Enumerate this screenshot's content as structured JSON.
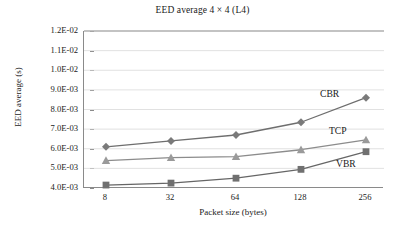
{
  "chart_data": {
    "type": "line",
    "title": "EED average 4 × 4 (L4)",
    "xlabel": "Packet size (bytes)",
    "ylabel": "EED average (s)",
    "categories": [
      "8",
      "32",
      "64",
      "128",
      "256"
    ],
    "xtick_labels": [
      "8",
      "32",
      "64",
      "128",
      "256"
    ],
    "ytick_labels": [
      "1.2E-02",
      "1.1E-02",
      "1.0E-02",
      "9.0E-03",
      "8.0E-03",
      "7.0E-03",
      "6.0E-03",
      "5.0E-03",
      "4.0E-03"
    ],
    "ytick_values": [
      0.012,
      0.011,
      0.01,
      0.009,
      0.008,
      0.007,
      0.006,
      0.005,
      0.004
    ],
    "ylim": [
      0.004,
      0.012
    ],
    "grid": "horizontal",
    "legend_position": "inline-annotations",
    "series": [
      {
        "name": "CBR",
        "marker": "diamond",
        "color": "#7a7a7a",
        "line_color": "#6e6e6e",
        "values": [
          0.0061,
          0.0064,
          0.0067,
          0.00735,
          0.0086
        ],
        "annotation": "CBR"
      },
      {
        "name": "TCP",
        "marker": "triangle",
        "color": "#9a9a9a",
        "line_color": "#8c8c8c",
        "values": [
          0.0054,
          0.00555,
          0.0056,
          0.00595,
          0.00645
        ],
        "annotation": "TCP"
      },
      {
        "name": "VBR",
        "marker": "square",
        "color": "#707070",
        "line_color": "#666666",
        "values": [
          0.00415,
          0.00425,
          0.0045,
          0.00495,
          0.00585
        ],
        "annotation": "VBR"
      }
    ],
    "annotations": [
      {
        "label": "CBR",
        "x": 320,
        "y": 88
      },
      {
        "label": "TCP",
        "x": 329,
        "y": 125
      },
      {
        "label": "VBR",
        "x": 336,
        "y": 158
      }
    ],
    "colors": {
      "axis": "#8a8a8a",
      "grid": "#d9d9d9",
      "text": "#1a1a1a",
      "background": "#ffffff"
    }
  }
}
